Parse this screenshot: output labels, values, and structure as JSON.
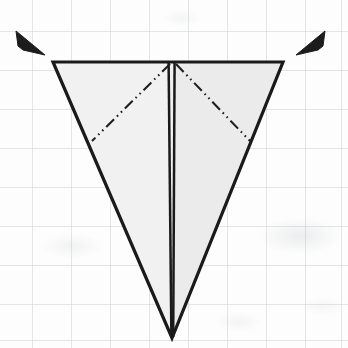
{
  "figure": {
    "kind": "origami-fold-step-diagram",
    "title": "Inverted triangle with centre crease and two symmetric fold lines",
    "canvas": {
      "width": 348,
      "height": 348
    },
    "background": {
      "name": "graph-paper",
      "paper_color": "#fdfdfd",
      "grid_color": "#cdd2d7",
      "grid_spacing_px": 39,
      "grid_offset_x": -7,
      "grid_offset_y": -8
    },
    "colors": {
      "ink": "#1a1a1a",
      "paper_fill": "#efefef",
      "paper_fill_right": "#ececec",
      "arrow_fill": "#1c1c1c"
    },
    "shape": {
      "name": "inverted-triangle-outline",
      "points": "53,62 283,62 172,338",
      "stroke_width": 3.2,
      "fill": "#efefef"
    },
    "left_panel": {
      "name": "left-paper-panel",
      "points": "53,62 169,62 171,336"
    },
    "right_panel": {
      "name": "right-paper-panel",
      "points": "175,62 283,62 174,336"
    },
    "center_crease": {
      "name": "center-vertical-crease",
      "line_a": {
        "x1": 168.5,
        "y1": 62,
        "x2": 171.5,
        "y2": 337
      },
      "line_b": {
        "x1": 174.5,
        "y1": 62,
        "x2": 173.0,
        "y2": 337
      },
      "stroke_width": 2.6
    },
    "fold_lines": [
      {
        "name": "fold-line-left",
        "style": "dash-dot-dot",
        "x1": 170,
        "y1": 64,
        "x2": 92,
        "y2": 141,
        "dash_pattern": "11,4,1.6,4,1.6,4",
        "stroke_width": 2.1
      },
      {
        "name": "fold-line-right",
        "style": "dash-dot-dot",
        "x1": 176,
        "y1": 64,
        "x2": 250,
        "y2": 141,
        "dash_pattern": "11,4,1.6,4,1.6,4",
        "stroke_width": 2.1
      }
    ],
    "arrows": [
      {
        "name": "fold-arrow-left",
        "points": "16,31 45,55 23,50 18,46",
        "direction": "down-right",
        "fill": "#1c1c1c"
      },
      {
        "name": "fold-arrow-right",
        "points": "325,31 296,55 318,50 323,46",
        "direction": "down-left",
        "fill": "#1c1c1c"
      }
    ]
  }
}
